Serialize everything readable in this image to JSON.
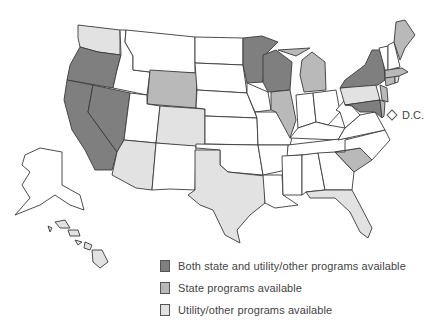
{
  "map": {
    "type": "choropleth",
    "region": "United States",
    "categories": {
      "both": {
        "label": "Both state and utility/other programs available",
        "color": "#7f7f7f"
      },
      "state": {
        "label": "State programs available",
        "color": "#b9b9b9"
      },
      "util": {
        "label": "Utility/other programs available",
        "color": "#e2e2e2"
      },
      "none": {
        "label": "",
        "color": "#ffffff"
      }
    },
    "states": {
      "both": [
        "Oregon",
        "California",
        "Nevada",
        "Minnesota",
        "Wisconsin",
        "New York",
        "Maryland"
      ],
      "state": [
        "Wyoming",
        "Illinois",
        "Michigan",
        "Maine",
        "Massachusetts",
        "Connecticut",
        "New Jersey",
        "Delaware",
        "South Carolina"
      ],
      "util": [
        "Washington",
        "Colorado",
        "Arizona",
        "Texas",
        "Florida",
        "Pennsylvania",
        "Rhode Island",
        "Hawaii"
      ],
      "none": [
        "Idaho",
        "Montana",
        "North Dakota",
        "South Dakota",
        "Nebraska",
        "Kansas",
        "Oklahoma",
        "Utah",
        "New Mexico",
        "Iowa",
        "Missouri",
        "Arkansas",
        "Louisiana",
        "Mississippi",
        "Alabama",
        "Georgia",
        "Tennessee",
        "Kentucky",
        "Indiana",
        "Ohio",
        "West Virginia",
        "Virginia",
        "North Carolina",
        "Vermont",
        "New Hampshire",
        "Alaska"
      ]
    },
    "dc": {
      "label": "D.C.",
      "category": "none"
    }
  },
  "legend": {
    "items": [
      {
        "key": "both",
        "label": "Both state and utility/other programs available",
        "color": "#7f7f7f"
      },
      {
        "key": "state",
        "label": "State programs available",
        "color": "#b9b9b9"
      },
      {
        "key": "util",
        "label": "Utility/other programs available",
        "color": "#e2e2e2"
      }
    ]
  }
}
